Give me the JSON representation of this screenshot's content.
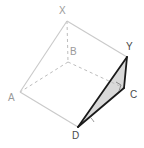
{
  "figure": {
    "width": 144,
    "height": 148,
    "background": "#ffffff",
    "colors": {
      "visible_edge": "#c9c9c9",
      "hidden_edge": "#bdbdbd",
      "highlight_edge": "#1a1a1a",
      "shade_fill": "#d9d9d9",
      "label_dark": "#4a4a4a",
      "label_faint": "#9a9a9a",
      "angle_mark": "#6b6b6b"
    },
    "vertices": [
      {
        "id": "X",
        "label": "X",
        "x": 67,
        "y": 21,
        "label_x": 59,
        "label_y": 6,
        "hidden": false
      },
      {
        "id": "Y",
        "label": "Y",
        "x": 127,
        "y": 57,
        "label_x": 126,
        "label_y": 42,
        "hidden": false
      },
      {
        "id": "A",
        "label": "A",
        "x": 20,
        "y": 92,
        "label_x": 8,
        "label_y": 93,
        "hidden": false
      },
      {
        "id": "B",
        "label": "B",
        "x": 68,
        "y": 62,
        "label_x": 70,
        "label_y": 47,
        "hidden": true
      },
      {
        "id": "C",
        "label": "C",
        "x": 124,
        "y": 88,
        "label_x": 130,
        "label_y": 90,
        "hidden": false
      },
      {
        "id": "D",
        "label": "D",
        "x": 78,
        "y": 127,
        "label_x": 72,
        "label_y": 131,
        "hidden": false
      }
    ],
    "edges": [
      {
        "from": "X",
        "to": "A",
        "style": "solid",
        "weight": "thin",
        "name": "edge-x-a"
      },
      {
        "from": "X",
        "to": "Y",
        "style": "solid",
        "weight": "thin",
        "name": "edge-x-y"
      },
      {
        "from": "A",
        "to": "D",
        "style": "solid",
        "weight": "thin",
        "name": "edge-a-d"
      },
      {
        "from": "D",
        "to": "C",
        "style": "solid",
        "weight": "thin",
        "name": "edge-d-c-base"
      },
      {
        "from": "Y",
        "to": "C",
        "style": "solid",
        "weight": "thin",
        "name": "edge-y-c-thin"
      },
      {
        "from": "X",
        "to": "B",
        "style": "dashed",
        "weight": "thin",
        "name": "edge-x-b-hidden"
      },
      {
        "from": "B",
        "to": "A",
        "style": "dashed",
        "weight": "thin",
        "name": "edge-b-a-hidden"
      },
      {
        "from": "B",
        "to": "C",
        "style": "dashed",
        "weight": "thin",
        "name": "edge-b-c-hidden"
      },
      {
        "from": "D",
        "to": "Y",
        "style": "solid",
        "weight": "bold",
        "name": "edge-d-y"
      },
      {
        "from": "D",
        "to": "C",
        "style": "solid",
        "weight": "bold",
        "name": "edge-d-c"
      },
      {
        "from": "Y",
        "to": "C",
        "style": "solid",
        "weight": "bold",
        "name": "edge-y-c"
      }
    ],
    "shaded_faces": [
      {
        "name": "face-dyc",
        "vertices": [
          "D",
          "Y",
          "C"
        ],
        "fill": "#d9d9d9"
      }
    ],
    "angle_marks": [
      {
        "name": "right-angle-at-c",
        "type": "right-angle",
        "at": "C",
        "size": 8
      },
      {
        "name": "angle-arc-at-d",
        "type": "arc",
        "at": "D",
        "radius": 16
      }
    ]
  }
}
